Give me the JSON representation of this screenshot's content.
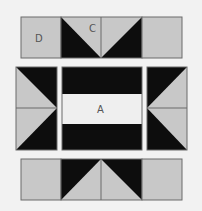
{
  "diagram": {
    "type": "quilt-block-layout",
    "colors": {
      "background": "#f2f2f2",
      "light": "#c8c8c8",
      "dark": "#0d0d0d",
      "center": "#efefef",
      "border": "#6b6b6b"
    },
    "labels": {
      "D": "D",
      "C": "C",
      "A": "A"
    },
    "rows": [
      {
        "name": "top-row",
        "units": [
          "D square",
          "C flying-geese unit (left half)",
          "C flying-geese unit (right half)",
          "corner square"
        ]
      },
      {
        "name": "middle-row",
        "units": [
          "left side flying-geese unit",
          "A center unit",
          "right side flying-geese unit"
        ]
      },
      {
        "name": "bottom-row",
        "units": [
          "corner square",
          "flying-geese unit (left half)",
          "flying-geese unit (right half)",
          "corner square"
        ]
      }
    ]
  }
}
